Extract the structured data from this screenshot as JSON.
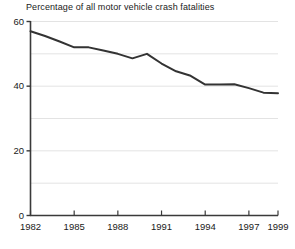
{
  "chart": {
    "title": "Percentage of all motor vehicle crash fatalities",
    "y_labels": [
      "60",
      "40",
      "20",
      "0"
    ],
    "x_labels": [
      "1982",
      "1985",
      "1988",
      "1991",
      "1994",
      "1997",
      "1999"
    ]
  },
  "chart_data": {
    "type": "line",
    "title": "Percentage of all motor vehicle crash fatalities",
    "xlabel": "",
    "ylabel": "",
    "xlim": [
      1982,
      1999
    ],
    "ylim": [
      0,
      60
    ],
    "grid": true,
    "grid_interval": 10,
    "legend": "none",
    "x": [
      1982,
      1983,
      1984,
      1985,
      1986,
      1987,
      1988,
      1989,
      1990,
      1991,
      1992,
      1993,
      1994,
      1995,
      1996,
      1997,
      1998,
      1999
    ],
    "values": [
      57.0,
      55.5,
      53.8,
      52.0,
      52.0,
      51.0,
      50.0,
      48.6,
      50.0,
      47.0,
      44.6,
      43.2,
      40.5,
      40.5,
      40.6,
      39.4,
      38.0,
      37.8
    ],
    "series": [
      {
        "name": "Percentage of all motor vehicle crash fatalities",
        "values": [
          57.0,
          55.5,
          53.8,
          52.0,
          52.0,
          51.0,
          50.0,
          48.6,
          50.0,
          47.0,
          44.6,
          43.2,
          40.5,
          40.5,
          40.6,
          39.4,
          38.0,
          37.8
        ],
        "color": "#333333"
      }
    ],
    "x_ticks": [
      1982,
      1985,
      1988,
      1991,
      1994,
      1997,
      1999
    ],
    "y_ticks": [
      0,
      20,
      40,
      60
    ],
    "y_tick_labels": [
      "0",
      "20",
      "40",
      "60"
    ],
    "x_tick_labels": [
      "1982",
      "1985",
      "1988",
      "1991",
      "1994",
      "1997",
      "1999"
    ],
    "gridline_values": [
      10,
      20,
      30,
      40,
      50,
      60
    ],
    "line_color": "#333333",
    "grid_color": "#e3e3e3",
    "axis_color": "#3a3a3a",
    "background_color": "#ffffff"
  }
}
